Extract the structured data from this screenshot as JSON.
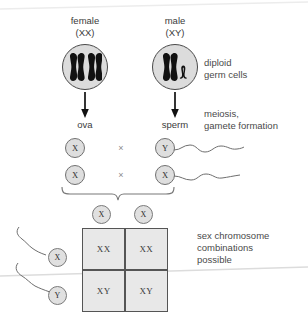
{
  "diagram": {
    "title_female": "female\n(XX)",
    "title_male": "male\n(XY)",
    "label_ova": "ova",
    "label_sperm": "sperm",
    "note_diploid": "diploid\ngerm cells",
    "note_meiosis": "meiosis,\ngamete formation",
    "note_combinations": "sex chromosome\ncombinations\npossible",
    "cross_symbol": "×",
    "parents": [
      {
        "sex": "female",
        "karyotype": "XX",
        "chromosomes": [
          "X",
          "X"
        ]
      },
      {
        "sex": "male",
        "karyotype": "XY",
        "chromosomes": [
          "X",
          "Y"
        ]
      }
    ],
    "gamete_pairings": [
      {
        "ovum": "X",
        "symbol": "×",
        "sperm": "Y"
      },
      {
        "ovum": "X",
        "symbol": "×",
        "sperm": "X"
      }
    ],
    "punnett": {
      "column_headers": [
        "X",
        "X"
      ],
      "row_headers": [
        "X",
        "Y"
      ],
      "cells": [
        [
          "XX",
          "XX"
        ],
        [
          "XY",
          "XY"
        ]
      ]
    },
    "colors": {
      "cell_fill": "#dcdcdc",
      "chromosome": "#111111",
      "grid_fill": "#e8e8e8",
      "grid_stroke": "#555555",
      "gamete_fill": "#dedede",
      "text": "#3b3b3b"
    }
  }
}
